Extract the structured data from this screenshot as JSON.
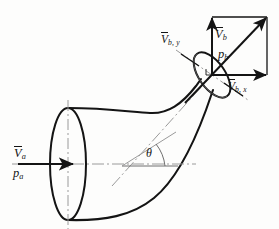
{
  "figure": {
    "type": "engineering-diagram",
    "background_color": "#fdfdfc",
    "line_color": "#141414",
    "centerline_color": "#9a9a9a",
    "labels": {
      "inlet_velocity": "V",
      "inlet_velocity_sub": "a",
      "inlet_pressure": "p",
      "inlet_pressure_sub": "a",
      "outlet_velocity": "V",
      "outlet_velocity_sub": "b",
      "outlet_pressure": "p",
      "outlet_pressure_sub": "b",
      "outlet_velocity_y": "V",
      "outlet_velocity_y_sub": "b, y",
      "outlet_velocity_x": "V",
      "outlet_velocity_x_sub": "b, x",
      "angle": "θ"
    },
    "geometry": {
      "inlet_center": [
        68,
        164
      ],
      "inlet_radius_x": 18,
      "inlet_radius_y": 56,
      "outlet_center": [
        212,
        75
      ],
      "outlet_radius_x": 13,
      "outlet_radius_y": 26,
      "outlet_tilt_deg": -35,
      "vector_origin": [
        212,
        75
      ],
      "vector_tip_diagonal": [
        267,
        17
      ],
      "vector_tip_vertical": [
        212,
        17
      ],
      "vector_tip_horizontal": [
        267,
        75
      ],
      "angle_vertex": [
        168,
        166
      ],
      "angle_arc_radius": 22
    }
  }
}
